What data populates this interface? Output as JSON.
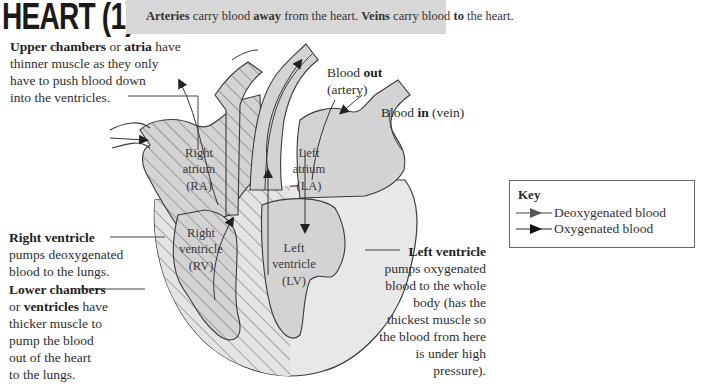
{
  "title": "HEART (1)",
  "banner": {
    "parts": [
      {
        "text": "Arteries",
        "bold": true
      },
      {
        "text": " carry blood ",
        "bold": false
      },
      {
        "text": "away",
        "bold": true
      },
      {
        "text": " from the heart. ",
        "bold": false
      },
      {
        "text": "Veins",
        "bold": true
      },
      {
        "text": " carry blood ",
        "bold": false
      },
      {
        "text": "to",
        "bold": true
      },
      {
        "text": " the heart.",
        "bold": false
      }
    ]
  },
  "labels": {
    "upper_chambers": {
      "bold1": "Upper chambers",
      "t1": " or ",
      "bold2": "atria",
      "t2": " have",
      "lines": [
        "thinner muscle as they only",
        "have to push blood down",
        "into the ventricles."
      ]
    },
    "blood_out": {
      "t1": "Blood ",
      "bold": "out",
      "line2": "(artery)"
    },
    "blood_in": {
      "t1": "Blood ",
      "bold": "in",
      "t2": " (vein)"
    },
    "right_ventricle": {
      "bold": "Right ventricle",
      "lines": [
        "pumps deoxygenated",
        "blood to the lungs."
      ]
    },
    "lower_chambers": {
      "bold1": "Lower chambers",
      "t1": "or ",
      "bold2": "ventricles",
      "t2": " have",
      "lines": [
        "thicker muscle to",
        "pump the blood",
        "out of the heart",
        "to the lungs."
      ]
    },
    "left_ventricle": {
      "bold": "Left ventricle",
      "lines": [
        "pumps oxygenated",
        "blood to the whole",
        "body (has the",
        "thickest muscle so",
        "the blood from here",
        "is under high",
        "pressure)."
      ]
    }
  },
  "chambers": {
    "ra": [
      "Right",
      "atrium",
      "(RA)"
    ],
    "la": [
      "Left",
      "atrium",
      "(LA)"
    ],
    "rv": [
      "Right",
      "ventricle",
      "(RV)"
    ],
    "lv": [
      "Left",
      "ventricle",
      "(LV)"
    ]
  },
  "key": {
    "title": "Key",
    "items": [
      {
        "label": "Deoxygenated blood",
        "icon": "arrow-dark-gray",
        "color": "#555555"
      },
      {
        "label": "Oxygenated blood",
        "icon": "arrow-black",
        "color": "#111111"
      }
    ]
  },
  "colors": {
    "banner": "#d7d7d7",
    "heart_fill": "#e6e6e6",
    "chamber_fill": "#d3d3d3",
    "outline": "#3a3a3a"
  }
}
